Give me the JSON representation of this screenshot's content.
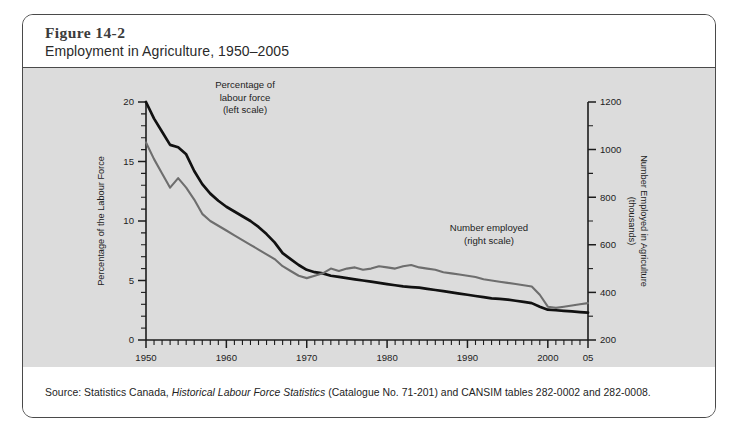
{
  "figure": {
    "number": "Figure 14-2",
    "subtitle": "Employment in Agriculture, 1950–2005",
    "source_prefix": "Source: Statistics Canada, ",
    "source_italic": "Historical Labour Force Statistics",
    "source_suffix": " (Catalogue No. 71-201) and CANSIM tables 282-0002 and 282-0008."
  },
  "chart_data": {
    "type": "line",
    "title": "Employment in Agriculture, 1950–2005",
    "xlabel": "Year",
    "ylabel": "Percentage of the Labour Force",
    "y2label": "Number Employed in Agriculture (thousands)",
    "grid": false,
    "legend": "inline-annotations",
    "xlim": [
      1950,
      2005
    ],
    "ylim": [
      0,
      20
    ],
    "y2lim": [
      200,
      1200
    ],
    "xticks": [
      1950,
      1960,
      1970,
      1980,
      1990,
      2000,
      2005
    ],
    "xticklabels": [
      "1950",
      "1960",
      "1970",
      "1980",
      "1990",
      "2000",
      "05"
    ],
    "xminortick_interval": 1,
    "yticks": [
      0,
      5,
      10,
      15,
      20
    ],
    "yticklabels": [
      "0",
      "5",
      "10",
      "15",
      "20"
    ],
    "yminortick_interval": 1,
    "y2ticks": [
      200,
      400,
      600,
      800,
      1000,
      1200
    ],
    "y2ticklabels": [
      "200",
      "400",
      "600",
      "800",
      "1000",
      "1200"
    ],
    "annotations": [
      {
        "name": "percentage-annotation",
        "text": "Percentage of\nlabour force\n(left scale)",
        "line1": "Percentage of",
        "line2": "labour force",
        "line3": "(left scale)"
      },
      {
        "name": "number-annotation",
        "text": "Number employed\n(right scale)",
        "line1": "Number employed",
        "line2": "(right scale)"
      }
    ],
    "x": [
      1950,
      1951,
      1952,
      1953,
      1954,
      1955,
      1956,
      1957,
      1958,
      1959,
      1960,
      1961,
      1962,
      1963,
      1964,
      1965,
      1966,
      1967,
      1968,
      1969,
      1970,
      1971,
      1972,
      1973,
      1974,
      1975,
      1976,
      1977,
      1978,
      1979,
      1980,
      1981,
      1982,
      1983,
      1984,
      1985,
      1986,
      1987,
      1988,
      1989,
      1990,
      1991,
      1992,
      1993,
      1994,
      1995,
      1996,
      1997,
      1998,
      1999,
      2000,
      2001,
      2002,
      2003,
      2004,
      2005
    ],
    "series": [
      {
        "name": "Percentage of labour force (left scale)",
        "axis": "left",
        "color": "#111111",
        "units": "percent",
        "values": [
          20.0,
          18.6,
          17.5,
          16.4,
          16.2,
          15.6,
          14.2,
          13.1,
          12.3,
          11.7,
          11.2,
          10.8,
          10.4,
          10.0,
          9.5,
          8.9,
          8.2,
          7.3,
          6.8,
          6.3,
          5.9,
          5.7,
          5.6,
          5.4,
          5.3,
          5.2,
          5.1,
          5.0,
          4.9,
          4.8,
          4.7,
          4.6,
          4.5,
          4.45,
          4.4,
          4.3,
          4.2,
          4.1,
          4.0,
          3.9,
          3.8,
          3.7,
          3.6,
          3.5,
          3.45,
          3.4,
          3.3,
          3.2,
          3.1,
          2.8,
          2.55,
          2.5,
          2.45,
          2.4,
          2.35,
          2.3
        ]
      },
      {
        "name": "Number employed (right scale)",
        "axis": "right",
        "color": "#6e6e6e",
        "units": "thousands",
        "values": [
          1030,
          960,
          900,
          840,
          880,
          840,
          790,
          730,
          700,
          680,
          660,
          640,
          620,
          600,
          580,
          560,
          540,
          510,
          490,
          470,
          460,
          470,
          480,
          500,
          490,
          500,
          505,
          495,
          500,
          510,
          505,
          500,
          510,
          515,
          505,
          500,
          495,
          485,
          480,
          475,
          470,
          465,
          455,
          450,
          445,
          440,
          435,
          430,
          425,
          390,
          340,
          335,
          340,
          345,
          350,
          355
        ]
      }
    ]
  }
}
